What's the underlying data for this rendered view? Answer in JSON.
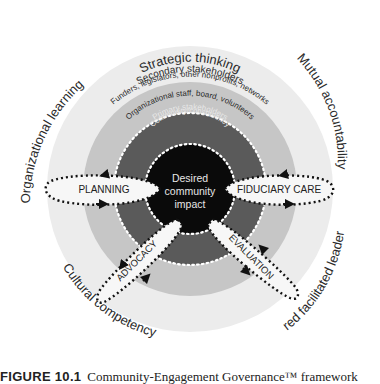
{
  "colors": {
    "outer_ring": "#ececec",
    "middle_ring": "#c6c6c6",
    "inner_ring": "#5a5a5a",
    "core": "#0a0a0a",
    "loop_fill": "#f7f7f7",
    "loop_stroke": "#111111",
    "text_dark": "#2a2a2a"
  },
  "outer_competencies": {
    "top": "Strategic thinking",
    "top_right": "Mutual accountability",
    "bottom_right": "Shared facilitated leadership",
    "bottom_left": "Cultural competency",
    "top_left": "Organizational learning"
  },
  "rings": {
    "secondary_title": "Secondary stakeholders",
    "secondary_subtitle": "Funders, legislators, other nonprofits, networks",
    "organizational": "Organizational staff, board, volunteers",
    "primary_title": "Primary stakeholders",
    "primary_subtitle": "Community/constituency"
  },
  "core": {
    "line1": "Desired",
    "line2": "community",
    "line3": "impact"
  },
  "functions": {
    "planning": "PLANNING",
    "fiduciary": "FIDUCIARY CARE",
    "advocacy": "ADVOCACY",
    "evaluation": "EVALUATION"
  },
  "caption": {
    "number": "FIGURE 10.1",
    "title": "Community-Engagement Governance™ framework"
  }
}
